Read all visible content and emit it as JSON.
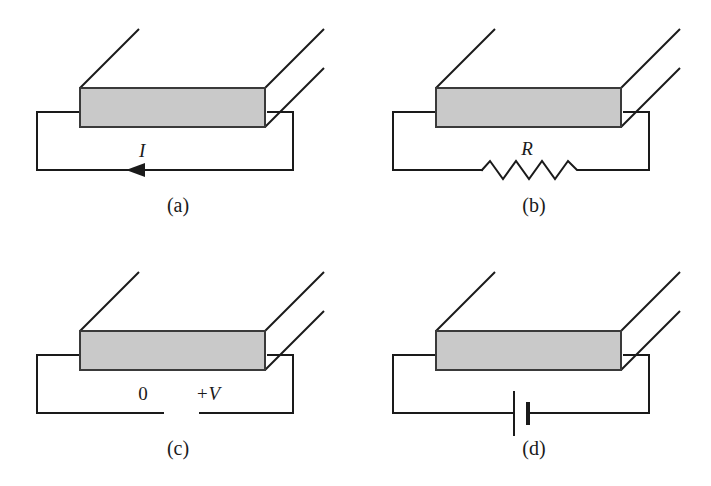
{
  "figure": {
    "background_color": "#ffffff",
    "line_color": "#1a1a1a",
    "slab_fill_color": "#c9c9c9",
    "slab_edge_color": "#3a3a3a"
  },
  "panels": [
    {
      "id": "a",
      "caption": "(a)",
      "element": "current-arrow",
      "label": "I",
      "label_meaning": "current",
      "arrow_direction": "left"
    },
    {
      "id": "b",
      "caption": "(b)",
      "element": "resistor",
      "label": "R",
      "label_meaning": "resistance"
    },
    {
      "id": "c",
      "caption": "(c)",
      "element": "voltage-terminals",
      "label_left": "0",
      "label_right": "+V",
      "label_meaning": "potential difference across the bar"
    },
    {
      "id": "d",
      "caption": "(d)",
      "element": "battery",
      "label": "",
      "label_meaning": "battery / EMF source"
    }
  ]
}
